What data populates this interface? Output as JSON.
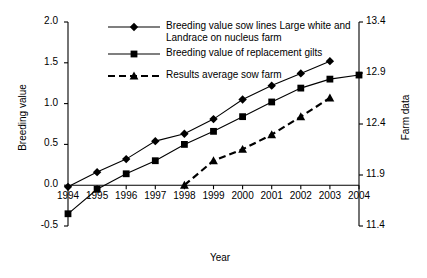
{
  "chart_data": {
    "type": "line",
    "title": "",
    "xlabel": "Year",
    "ylabel": "Breeding value",
    "ylabel_right": "Farm data",
    "x": [
      1994,
      1995,
      1996,
      1997,
      1998,
      1999,
      2000,
      2001,
      2002,
      2003,
      2004
    ],
    "xtick_labels": [
      "1994",
      "1995",
      "1996",
      "1997",
      "1998",
      "1999",
      "2000",
      "2001",
      "2002",
      "2003",
      "2004"
    ],
    "ylim": [
      -0.5,
      2.0
    ],
    "ytick_labels": [
      "2.0",
      "1.5",
      "1.0",
      "0.5",
      "0.0",
      "-0.5"
    ],
    "ytick_values": [
      2.0,
      1.5,
      1.0,
      0.5,
      0.0,
      -0.5
    ],
    "ylim_right": [
      11.4,
      13.4
    ],
    "ytick_labels_right": [
      "13.4",
      "12.9",
      "12.4",
      "11.9",
      "11.4"
    ],
    "ytick_values_right": [
      13.4,
      12.9,
      12.4,
      11.9,
      11.4
    ],
    "grid": false,
    "legend_position": "top-center",
    "series": [
      {
        "name": "Breeding value sow lines Large white and Landrace on nucleus farm",
        "marker": "diamond",
        "line_style": "solid",
        "axis": "left",
        "x": [
          1994,
          1995,
          1996,
          1997,
          1998,
          1999,
          2000,
          2001,
          2002,
          2003
        ],
        "values": [
          -0.02,
          0.16,
          0.32,
          0.54,
          0.63,
          0.81,
          1.05,
          1.22,
          1.37,
          1.52
        ]
      },
      {
        "name": "Breeding value of replacement gilts",
        "marker": "square",
        "line_style": "solid",
        "axis": "left",
        "x": [
          1994,
          1995,
          1996,
          1997,
          1998,
          1999,
          2000,
          2001,
          2002,
          2003,
          2004
        ],
        "values": [
          -0.35,
          -0.05,
          0.14,
          0.3,
          0.5,
          0.66,
          0.84,
          1.02,
          1.19,
          1.3,
          1.35
        ]
      },
      {
        "name": "Results average sow farm",
        "marker": "triangle",
        "line_style": "dashed",
        "axis": "left",
        "x": [
          1998,
          1999,
          2000,
          2001,
          2002,
          2003
        ],
        "values": [
          0.0,
          0.3,
          0.44,
          0.62,
          0.84,
          1.07
        ]
      }
    ]
  },
  "legend": {
    "items": [
      {
        "label_line1": "Breeding value sow lines Large white and",
        "label_line2": "Landrace on nucleus farm",
        "marker": "diamond",
        "style": "solid"
      },
      {
        "label_line1": "Breeding value of replacement gilts",
        "label_line2": "",
        "marker": "square",
        "style": "solid"
      },
      {
        "label_line1": "Results average sow farm",
        "label_line2": "",
        "marker": "triangle",
        "style": "dashed"
      }
    ]
  }
}
